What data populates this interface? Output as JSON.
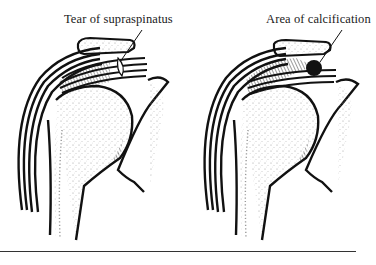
{
  "figure": {
    "panels": [
      {
        "id": "left",
        "label": "Tear of supraspinatus",
        "lesion": "tear"
      },
      {
        "id": "right",
        "label": "Area of calcification",
        "lesion": "calcification"
      }
    ],
    "colors": {
      "ink": "#111111",
      "stipple": "#9a9a9a",
      "paper": "#ffffff"
    }
  }
}
